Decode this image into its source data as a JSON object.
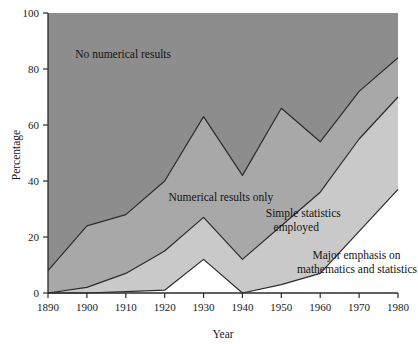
{
  "chart_data": {
    "type": "area",
    "title": "",
    "subtitle": "",
    "xlabel": "Year",
    "ylabel": "Percentage",
    "x": [
      1890,
      1900,
      1910,
      1920,
      1930,
      1940,
      1950,
      1960,
      1970,
      1980
    ],
    "xlim": [
      1890,
      1980
    ],
    "ylim": [
      0,
      100
    ],
    "xticks": [
      1890,
      1900,
      1910,
      1920,
      1930,
      1940,
      1950,
      1960,
      1970,
      1980
    ],
    "xtick_labels": [
      "1890",
      "1900",
      "1910",
      "1920",
      "1930",
      "1940",
      "1950",
      "1960",
      "1970",
      "1980"
    ],
    "yticks": [
      0,
      20,
      40,
      60,
      80,
      100
    ],
    "ytick_labels": [
      "0",
      "20",
      "40",
      "60",
      "80",
      "100"
    ],
    "grid": false,
    "legend_position": "inline-annotations",
    "stacking": "cumulative-boundaries",
    "boundaries": [
      {
        "name": "Major emphasis on mathematics and statistics",
        "description": "lowest cumulative boundary",
        "values": [
          0,
          0,
          0.5,
          1,
          12,
          0,
          3,
          7,
          22,
          37
        ]
      },
      {
        "name": "Simple statistics employed",
        "description": "middle cumulative boundary",
        "values": [
          0,
          2,
          7,
          15,
          27,
          12,
          24,
          36,
          55,
          70
        ]
      },
      {
        "name": "Numerical results only",
        "description": "upper cumulative boundary",
        "values": [
          8,
          24,
          28,
          40,
          63,
          42,
          66,
          54,
          72,
          84
        ]
      },
      {
        "name": "No numerical results",
        "description": "top of chart to upper boundary",
        "values": [
          100,
          100,
          100,
          100,
          100,
          100,
          100,
          100,
          100,
          100
        ]
      }
    ],
    "bands": [
      {
        "label": "No numerical results",
        "color": "#8d8d8d",
        "label_x": 1905,
        "label_y": 84
      },
      {
        "label": "Numerical results only",
        "color": "#a8a8a8",
        "label_x": 1927,
        "label_y": 33
      },
      {
        "label": "Simple statistics employed",
        "color": "#c9c9c9",
        "label_x": 1951,
        "label_y": 23
      },
      {
        "label": "Major emphasis on mathematics and statistics",
        "color": "#ffffff",
        "label_x": 1964,
        "label_y": 9
      }
    ],
    "annotations": [
      {
        "text": "No numerical results",
        "x": 1897,
        "y": 84
      },
      {
        "text": "Numerical results only",
        "x": 1921,
        "y": 33
      },
      {
        "text": "Simple statistics",
        "x": 1946,
        "y": 27
      },
      {
        "text": "employed",
        "x": 1948,
        "y": 22
      },
      {
        "text": "Major emphasis on",
        "x": 1958,
        "y": 12
      },
      {
        "text": "mathematics and statistics",
        "x": 1954,
        "y": 7
      }
    ],
    "colors": {
      "band_top": "#8d8d8d",
      "band_second": "#a8a8a8",
      "band_third": "#c9c9c9",
      "band_bottom": "#ffffff",
      "line": "#2b2b2b",
      "axis": "#2b2b2b",
      "text": "#141414",
      "background": "#ffffff"
    }
  },
  "axes": {
    "y_title": "Percentage",
    "x_title": "Year"
  }
}
